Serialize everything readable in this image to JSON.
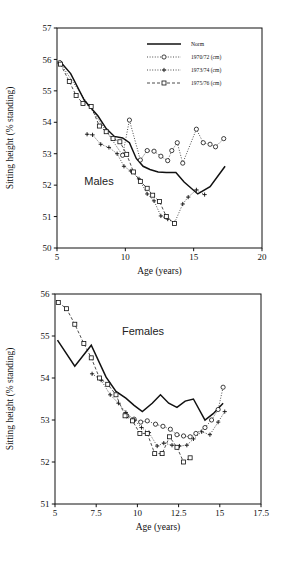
{
  "figure": {
    "background": "#ffffff",
    "foreground": "#111111"
  },
  "legend": {
    "entries": [
      {
        "label": "Norm",
        "style": "solid",
        "marker": "none"
      },
      {
        "label": "1970/72 (cm)",
        "style": "dotted",
        "marker": "circle"
      },
      {
        "label": "1973/74 (cm)",
        "style": "dotted",
        "marker": "plus"
      },
      {
        "label": "1975/76 (cm)",
        "style": "dashed",
        "marker": "square"
      }
    ]
  },
  "chart_data": [
    {
      "type": "line",
      "title": "Males",
      "panel_tag": "Males",
      "xlabel": "Age (years)",
      "ylabel": "Sitting height (% standing)",
      "xlim": [
        5,
        20
      ],
      "ylim": [
        50,
        57
      ],
      "xticks": [
        5,
        10,
        15,
        20
      ],
      "xticklabels": [
        "5",
        "10",
        "15",
        "20"
      ],
      "yticks": [
        50,
        51,
        52,
        53,
        54,
        55,
        56,
        57
      ],
      "yticklabels": [
        "50",
        "51",
        "52",
        "53",
        "54",
        "55",
        "56",
        "57"
      ],
      "grid": false,
      "legend_position": "top-right",
      "series": [
        {
          "name": "Norm",
          "style": "solid",
          "marker": "none",
          "x": [
            5.2,
            6.0,
            7.0,
            8.0,
            8.6,
            9.2,
            9.8,
            10.3,
            10.8,
            11.3,
            11.8,
            12.4,
            13.0,
            13.7,
            14.3,
            15.3,
            16.2,
            17.3
          ],
          "y": [
            55.95,
            55.55,
            54.7,
            54.2,
            53.8,
            53.55,
            53.5,
            53.35,
            52.85,
            52.6,
            52.5,
            52.42,
            52.4,
            52.4,
            52.1,
            51.72,
            51.95,
            52.6
          ]
        },
        {
          "name": "1970/72 (cm)",
          "style": "dotted",
          "marker": "circle",
          "x": [
            5.2,
            9.8,
            10.3,
            11.1,
            11.6,
            12.1,
            12.6,
            13.1,
            13.4,
            13.8,
            14.2,
            15.2,
            15.7,
            16.2,
            16.6,
            17.2
          ],
          "y": [
            55.9,
            52.95,
            54.07,
            52.8,
            53.1,
            53.08,
            52.92,
            52.78,
            53.1,
            53.35,
            52.7,
            53.78,
            53.35,
            53.3,
            53.22,
            53.48
          ]
        },
        {
          "name": "1973/74 (cm)",
          "style": "dotted",
          "marker": "plus",
          "x": [
            7.2,
            7.6,
            8.2,
            8.8,
            9.4,
            9.9,
            10.4,
            11.0,
            11.6,
            12.1,
            12.6,
            13.1,
            13.6,
            14.2,
            14.6,
            15.2,
            15.8
          ],
          "y": [
            53.62,
            53.6,
            53.3,
            53.2,
            53.0,
            52.6,
            52.45,
            52.2,
            51.72,
            51.5,
            51.02,
            50.92,
            50.8,
            51.4,
            51.62,
            51.85,
            51.7
          ]
        },
        {
          "name": "1975/76 (cm)",
          "style": "dashed",
          "marker": "square",
          "x": [
            5.25,
            5.9,
            6.4,
            6.9,
            7.5,
            8.1,
            8.6,
            9.1,
            9.6,
            10.1,
            10.6,
            11.1,
            11.6,
            12.0,
            12.5,
            13.0,
            13.6
          ],
          "y": [
            55.85,
            55.3,
            54.85,
            54.6,
            54.5,
            53.88,
            53.7,
            53.48,
            53.38,
            52.98,
            52.42,
            52.12,
            51.9,
            51.68,
            51.48,
            51.0,
            50.78
          ]
        }
      ]
    },
    {
      "type": "line",
      "title": "Females",
      "panel_tag": "Females",
      "xlabel": "Age (years)",
      "ylabel": "Sitting height (% standing)",
      "xlim": [
        5,
        17.5
      ],
      "ylim": [
        51,
        56
      ],
      "xticks": [
        5,
        7.5,
        10,
        12.5,
        15,
        17.5
      ],
      "xticklabels": [
        "5",
        "7.5",
        "10",
        "12.5",
        "15",
        "17.5"
      ],
      "yticks": [
        51,
        52,
        53,
        54,
        55,
        56
      ],
      "yticklabels": [
        "51",
        "52",
        "53",
        "54",
        "55",
        "56"
      ],
      "grid": false,
      "legend_position": "none",
      "series": [
        {
          "name": "Norm",
          "style": "solid",
          "marker": "none",
          "x": [
            5.15,
            6.2,
            7.2,
            8.1,
            8.7,
            9.3,
            9.8,
            10.3,
            10.9,
            11.4,
            11.9,
            12.4,
            12.9,
            13.4,
            14.1,
            14.6,
            15.2
          ],
          "y": [
            54.9,
            54.28,
            54.78,
            54.02,
            53.68,
            53.52,
            53.35,
            53.2,
            53.4,
            53.6,
            53.4,
            53.3,
            53.45,
            53.5,
            53.0,
            53.15,
            53.4
          ]
        },
        {
          "name": "1970/72 (cm)",
          "style": "dotted",
          "marker": "circle",
          "x": [
            9.35,
            9.8,
            10.2,
            10.6,
            11.1,
            11.55,
            12.0,
            12.4,
            12.8,
            13.2,
            13.55,
            14.1,
            14.5,
            14.9,
            15.2
          ],
          "y": [
            53.1,
            53.02,
            52.95,
            52.98,
            52.9,
            52.85,
            52.78,
            52.65,
            52.62,
            52.6,
            52.68,
            52.82,
            53.0,
            53.25,
            53.78
          ]
        },
        {
          "name": "1973/74 (cm)",
          "style": "dotted",
          "marker": "plus",
          "x": [
            7.25,
            7.8,
            8.35,
            8.85,
            9.3,
            9.8,
            10.25,
            10.7,
            11.2,
            11.6,
            12.1,
            12.55,
            13.0,
            13.4,
            13.9,
            14.4,
            14.9,
            15.3
          ],
          "y": [
            54.1,
            53.95,
            53.6,
            53.4,
            53.18,
            53.0,
            52.82,
            52.7,
            52.38,
            52.45,
            52.4,
            52.38,
            52.4,
            52.55,
            52.72,
            52.65,
            52.95,
            53.2
          ]
        },
        {
          "name": "1975/76 (cm)",
          "style": "dashed",
          "marker": "square",
          "x": [
            5.2,
            5.7,
            6.2,
            6.75,
            7.2,
            7.7,
            8.2,
            8.7,
            9.25,
            9.7,
            10.15,
            10.6,
            11.05,
            11.5,
            11.95,
            12.4,
            12.8,
            13.2
          ],
          "y": [
            55.8,
            55.65,
            55.28,
            54.82,
            54.48,
            54.0,
            53.85,
            53.6,
            53.1,
            52.98,
            52.68,
            52.68,
            52.2,
            52.2,
            52.6,
            52.35,
            52.0,
            52.1
          ]
        }
      ]
    }
  ]
}
